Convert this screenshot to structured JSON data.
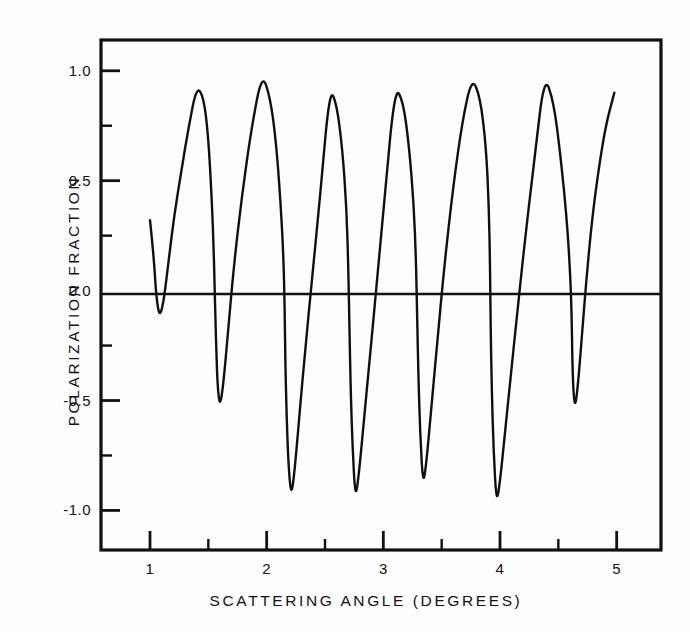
{
  "chart_data": {
    "type": "line",
    "title": "",
    "subtitle": "",
    "xlabel": "SCATTERING ANGLE (DEGREES)",
    "ylabel": "POLARIZATION FRACTION",
    "xlim": [
      0.58,
      5.38
    ],
    "ylim": [
      -1.18,
      1.14
    ],
    "grid": false,
    "legend": null,
    "xticks_major": [
      1,
      2,
      3,
      4,
      5
    ],
    "xticks_major_labels": [
      "1",
      "2",
      "3",
      "4",
      "5"
    ],
    "xticks_minor": [
      1.5,
      2.5,
      3.5,
      4.5
    ],
    "yticks_major": [
      1.0,
      0.5,
      0.0,
      -0.5,
      -1.0
    ],
    "yticks_major_labels": [
      "1.0",
      "0.5",
      "0.0",
      "-0.5",
      "-1.0"
    ],
    "yticks_minor": [
      0.75,
      0.25,
      -0.25,
      -0.75
    ],
    "zero_line": 0.0,
    "series": [
      {
        "name": "polarization fraction",
        "color": "#101010",
        "extrema": {
          "maxima_x": [
            1.4,
            1.96,
            2.54,
            3.1,
            3.76,
            4.46
          ],
          "maxima_y": [
            0.93,
            0.99,
            0.92,
            0.93,
            0.97,
            0.98
          ],
          "minima_x": [
            1.05,
            1.56,
            2.16,
            2.71,
            3.29,
            3.92,
            4.62
          ],
          "minima_y": [
            -0.11,
            -0.53,
            -0.94,
            -0.95,
            -0.89,
            -0.97,
            -0.53
          ]
        },
        "x": [
          1.0,
          1.02,
          1.04,
          1.05,
          1.07,
          1.09,
          1.12,
          1.16,
          1.21,
          1.27,
          1.33,
          1.4,
          1.46,
          1.5,
          1.53,
          1.545,
          1.555,
          1.56,
          1.57,
          1.58,
          1.6,
          1.63,
          1.67,
          1.72,
          1.79,
          1.87,
          1.96,
          2.03,
          2.08,
          2.12,
          2.145,
          2.155,
          2.16,
          2.17,
          2.185,
          2.21,
          2.24,
          2.28,
          2.33,
          2.39,
          2.46,
          2.54,
          2.6,
          2.65,
          2.685,
          2.7,
          2.71,
          2.72,
          2.735,
          2.76,
          2.79,
          2.83,
          2.88,
          2.94,
          3.01,
          3.1,
          3.17,
          3.22,
          3.26,
          3.28,
          3.29,
          3.3,
          3.315,
          3.34,
          3.37,
          3.41,
          3.46,
          3.52,
          3.6,
          3.68,
          3.76,
          3.83,
          3.88,
          3.905,
          3.915,
          3.92,
          3.93,
          3.945,
          3.97,
          4.0,
          4.04,
          4.09,
          4.15,
          4.22,
          4.3,
          4.38,
          4.46,
          4.52,
          4.57,
          4.6,
          4.615,
          4.62,
          4.63,
          4.645,
          4.67,
          4.7,
          4.74,
          4.79,
          4.85,
          4.91,
          4.98
        ],
        "y": [
          0.32,
          0.22,
          0.09,
          0.0,
          -0.09,
          -0.11,
          -0.04,
          0.14,
          0.35,
          0.55,
          0.74,
          0.93,
          0.88,
          0.7,
          0.41,
          0.2,
          0.0,
          -0.12,
          -0.3,
          -0.44,
          -0.53,
          -0.42,
          -0.18,
          0.12,
          0.44,
          0.74,
          0.99,
          0.88,
          0.68,
          0.4,
          0.14,
          -0.1,
          -0.33,
          -0.55,
          -0.78,
          -0.94,
          -0.82,
          -0.57,
          -0.27,
          0.06,
          0.44,
          0.92,
          0.85,
          0.64,
          0.37,
          0.1,
          -0.18,
          -0.45,
          -0.7,
          -0.95,
          -0.84,
          -0.61,
          -0.33,
          0.01,
          0.42,
          0.93,
          0.86,
          0.66,
          0.4,
          0.14,
          -0.12,
          -0.38,
          -0.64,
          -0.89,
          -0.78,
          -0.54,
          -0.25,
          0.1,
          0.48,
          0.78,
          0.97,
          0.88,
          0.66,
          0.38,
          0.1,
          -0.18,
          -0.46,
          -0.73,
          -0.97,
          -0.87,
          -0.66,
          -0.4,
          -0.09,
          0.26,
          0.62,
          0.98,
          0.86,
          0.61,
          0.34,
          0.1,
          -0.12,
          -0.32,
          -0.47,
          -0.53,
          -0.42,
          -0.22,
          0.05,
          0.33,
          0.57,
          0.76,
          0.9
        ]
      }
    ]
  },
  "axes": {
    "xlabel": "SCATTERING ANGLE (DEGREES)",
    "ylabel": "POLARIZATION FRACTION",
    "x_tick_labels": [
      "1",
      "2",
      "3",
      "4",
      "5"
    ],
    "y_tick_labels": [
      "1.0",
      "0.5",
      "0.0",
      "-0.5",
      "-1.0"
    ]
  },
  "colors": {
    "curve": "#101010",
    "frame": "#111111",
    "background": "#fdfdfd"
  }
}
